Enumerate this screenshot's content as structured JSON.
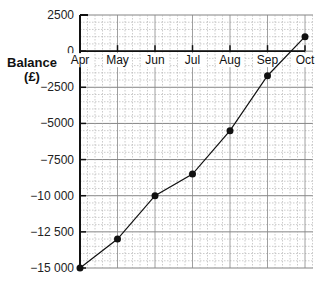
{
  "chart_data": {
    "type": "line",
    "title": "",
    "xlabel": "",
    "ylabel": "Balance (£)",
    "ylabel_lines": [
      "Balance",
      "(£)"
    ],
    "categories": [
      "Apr",
      "May",
      "Jun",
      "Jul",
      "Aug",
      "Sep",
      "Oct"
    ],
    "series": [
      {
        "name": "Balance",
        "values": [
          -15000,
          -13000,
          -10000,
          -8500,
          -5500,
          -1700,
          1000
        ]
      }
    ],
    "yticks": [
      2500,
      0,
      -2500,
      -5000,
      -7500,
      -10000,
      -12500,
      -15000
    ],
    "ytick_labels": [
      "2500",
      "0",
      "−2500",
      "−5000",
      "−7500",
      "−10 000",
      "−12 500",
      "−15 000"
    ],
    "ylim": [
      -15000,
      2500
    ],
    "grid": true,
    "legend": "none",
    "markers": true,
    "x_axis_at_zero": true
  }
}
